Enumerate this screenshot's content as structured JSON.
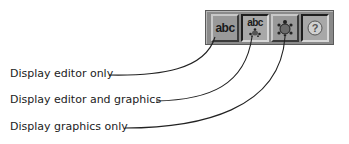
{
  "toolbar": {
    "buttons": [
      {
        "name": "display-editor-only",
        "icon": "abc-text-icon",
        "glyph": "abc",
        "state": "raised"
      },
      {
        "name": "display-editor-and-graphics",
        "icon": "abc-turtle-icon",
        "glyph": "abc",
        "state": "pressed"
      },
      {
        "name": "display-graphics-only",
        "icon": "turtle-icon",
        "state": "raised"
      },
      {
        "name": "help",
        "icon": "help-icon",
        "glyph": "?",
        "state": "pressed"
      }
    ]
  },
  "callouts": [
    {
      "label": "Display editor only"
    },
    {
      "label": "Display editor and graphics"
    },
    {
      "label": "Display graphics only"
    }
  ],
  "colors": {
    "toolbar_bg": "#8a8a8a",
    "line": "#222222",
    "text": "#222222"
  }
}
